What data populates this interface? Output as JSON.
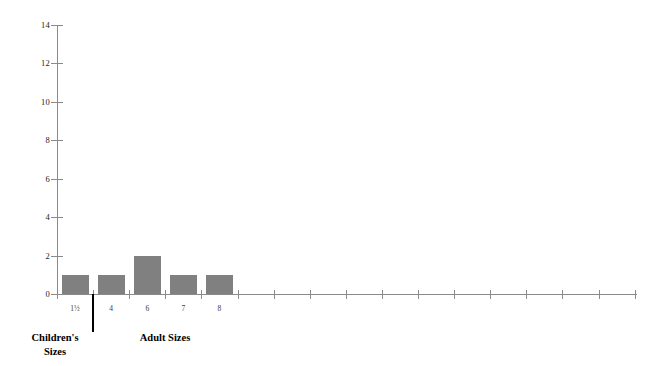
{
  "chart_data": {
    "type": "bar",
    "title": "",
    "subtitle": "",
    "xlabel": "",
    "ylabel": "",
    "categories": [
      "1½",
      "4",
      "6",
      "7",
      "8"
    ],
    "values": [
      1,
      1,
      2,
      1,
      1
    ],
    "ylim": [
      0,
      14
    ],
    "y_ticks": [
      0,
      2,
      4,
      6,
      8,
      10,
      12,
      14
    ],
    "y_tick_labels": [
      "0",
      "2",
      "4",
      "6",
      "8",
      "10",
      "12",
      "14"
    ],
    "x_tick_count": 17,
    "x_labeled_tick_count": 5,
    "grid": false,
    "legend": null,
    "bar_color": "#808080",
    "axis_color": "#8a8a8a",
    "annotations": [
      {
        "text": "Children's\nSizes",
        "role": "x-group-caption"
      },
      {
        "text": "Adult Sizes",
        "role": "x-group-caption"
      }
    ],
    "group_divider": {
      "after_category": "1½",
      "color": "#000000"
    }
  },
  "axes": {
    "y": {
      "ticks": [
        {
          "value": 14,
          "label": "14"
        },
        {
          "value": 12,
          "label": "12"
        },
        {
          "value": 10,
          "label": "10"
        },
        {
          "value": 8,
          "label": "8"
        },
        {
          "value": 6,
          "label": "6"
        },
        {
          "value": 4,
          "label": "4"
        },
        {
          "value": 2,
          "label": "2"
        },
        {
          "value": 0,
          "label": "0"
        }
      ]
    },
    "x": {
      "labels": [
        {
          "index": 0,
          "label": "1½"
        },
        {
          "index": 1,
          "label": "4"
        },
        {
          "index": 2,
          "label": "6"
        },
        {
          "index": 3,
          "label": "7"
        },
        {
          "index": 4,
          "label": "8"
        }
      ]
    }
  },
  "captions": {
    "children": "Children's\nSizes",
    "adult": "Adult Sizes"
  }
}
